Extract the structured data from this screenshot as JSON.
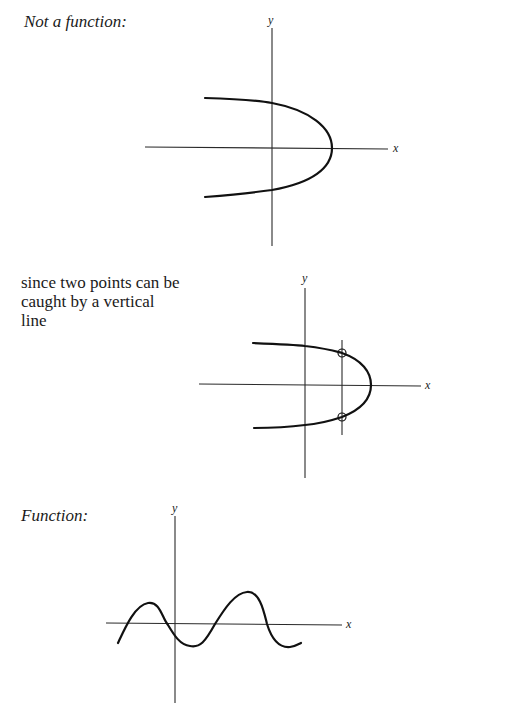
{
  "figure1": {
    "title": "Not a function:",
    "x_label": "x",
    "y_label": "y",
    "curve": "sideways parabola opening left"
  },
  "figure2": {
    "caption_lines": [
      "since two points can be",
      "caught by a vertical",
      "line"
    ],
    "x_label": "x",
    "y_label": "y",
    "curve": "sideways parabola opening left",
    "vertical_line": "vertical test line crossing curve twice",
    "intersections": 2
  },
  "figure3": {
    "title": "Function:",
    "x_label": "x",
    "y_label": "y",
    "curve": "wavy curve"
  }
}
